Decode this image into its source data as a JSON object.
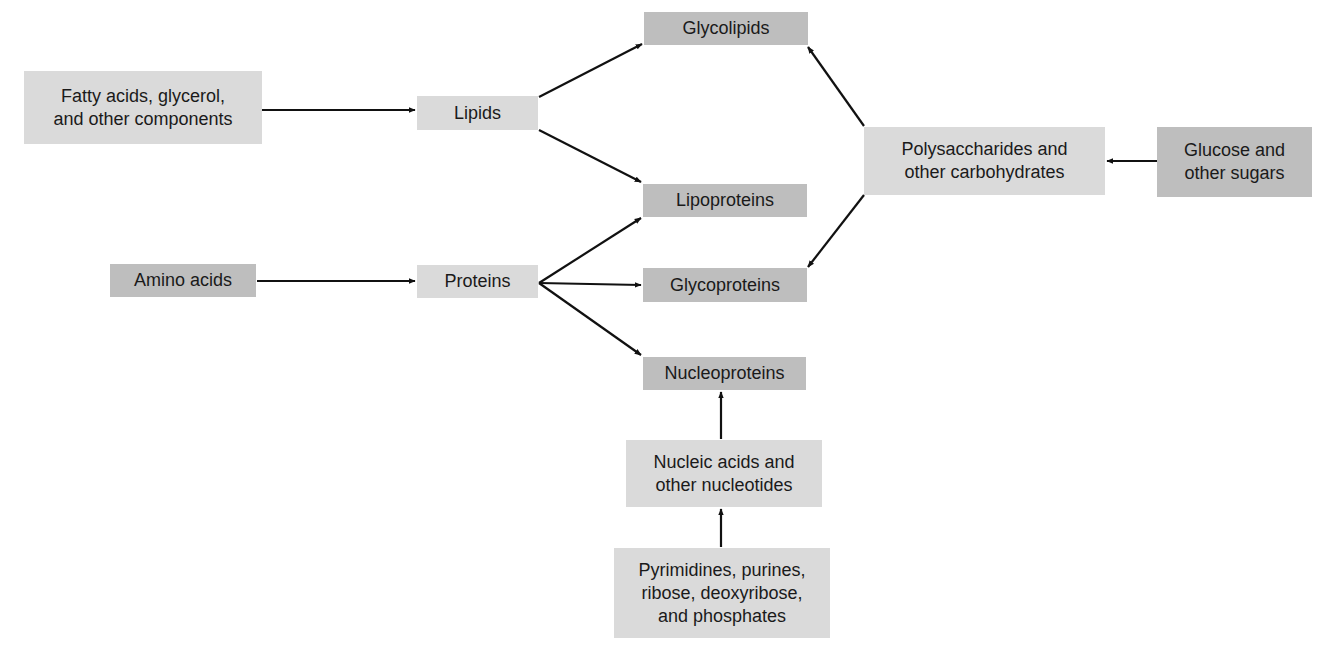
{
  "diagram": {
    "type": "flow",
    "colors": {
      "precursor_box": "#dadada",
      "product_box": "#bebebe",
      "arrow": "#111111",
      "background": "#ffffff"
    },
    "nodes": [
      {
        "id": "fatty",
        "label": "Fatty acids, glycerol,\nand other components",
        "style": "light",
        "x": 24,
        "y": 71,
        "w": 238,
        "h": 73
      },
      {
        "id": "lipids",
        "label": "Lipids",
        "style": "light",
        "x": 417,
        "y": 96,
        "w": 121,
        "h": 34
      },
      {
        "id": "glycolipids",
        "label": "Glycolipids",
        "style": "dark",
        "x": 644,
        "y": 12,
        "w": 164,
        "h": 33
      },
      {
        "id": "lipoproteins",
        "label": "Lipoproteins",
        "style": "dark",
        "x": 643,
        "y": 184,
        "w": 164,
        "h": 33
      },
      {
        "id": "polysacch",
        "label": "Polysaccharides and\nother carbohydrates",
        "style": "light",
        "x": 864,
        "y": 127,
        "w": 241,
        "h": 68
      },
      {
        "id": "glucose",
        "label": "Glucose and\nother sugars",
        "style": "dark",
        "x": 1157,
        "y": 127,
        "w": 155,
        "h": 70
      },
      {
        "id": "amino",
        "label": "Amino acids",
        "style": "dark",
        "x": 110,
        "y": 264,
        "w": 146,
        "h": 33
      },
      {
        "id": "proteins",
        "label": "Proteins",
        "style": "light",
        "x": 417,
        "y": 265,
        "w": 121,
        "h": 33
      },
      {
        "id": "glycoproteins",
        "label": "Glycoproteins",
        "style": "dark",
        "x": 643,
        "y": 268,
        "w": 164,
        "h": 34
      },
      {
        "id": "nucleoproteins",
        "label": "Nucleoproteins",
        "style": "dark",
        "x": 643,
        "y": 357,
        "w": 163,
        "h": 33
      },
      {
        "id": "nucleic",
        "label": "Nucleic acids and\nother nucleotides",
        "style": "light",
        "x": 626,
        "y": 440,
        "w": 196,
        "h": 67
      },
      {
        "id": "pyrimidines",
        "label": "Pyrimidines, purines,\nribose, deoxyribose,\nand phosphates",
        "style": "light",
        "x": 614,
        "y": 548,
        "w": 216,
        "h": 90
      }
    ],
    "edges": [
      {
        "from": "fatty",
        "to": "lipids",
        "x1": 262,
        "y1": 110,
        "x2": 415,
        "y2": 110
      },
      {
        "from": "lipids",
        "to": "glycolipids",
        "x1": 539,
        "y1": 97,
        "x2": 642,
        "y2": 44
      },
      {
        "from": "lipids",
        "to": "lipoproteins",
        "x1": 539,
        "y1": 130,
        "x2": 641,
        "y2": 182
      },
      {
        "from": "polysacch",
        "to": "glycolipids",
        "x1": 864,
        "y1": 126,
        "x2": 808,
        "y2": 47
      },
      {
        "from": "polysacch",
        "to": "glycoproteins",
        "x1": 864,
        "y1": 195,
        "x2": 808,
        "y2": 267
      },
      {
        "from": "glucose",
        "to": "polysacch",
        "x1": 1157,
        "y1": 161,
        "x2": 1107,
        "y2": 161
      },
      {
        "from": "amino",
        "to": "proteins",
        "x1": 257,
        "y1": 281,
        "x2": 415,
        "y2": 281
      },
      {
        "from": "proteins",
        "to": "lipoproteins",
        "x1": 539,
        "y1": 283,
        "x2": 641,
        "y2": 218
      },
      {
        "from": "proteins",
        "to": "glycoproteins",
        "x1": 539,
        "y1": 283,
        "x2": 641,
        "y2": 285
      },
      {
        "from": "proteins",
        "to": "nucleoproteins",
        "x1": 539,
        "y1": 283,
        "x2": 641,
        "y2": 355
      },
      {
        "from": "nucleic",
        "to": "nucleoproteins",
        "x1": 721,
        "y1": 439,
        "x2": 721,
        "y2": 392
      },
      {
        "from": "pyrimidines",
        "to": "nucleic",
        "x1": 721,
        "y1": 547,
        "x2": 721,
        "y2": 509
      }
    ]
  }
}
